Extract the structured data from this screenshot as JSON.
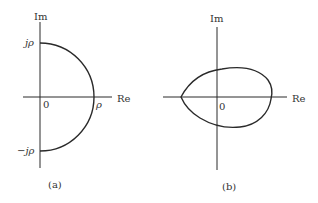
{
  "diagrams": [
    {
      "id": "a",
      "caption": "(a)",
      "axis_labels": {
        "imag": "Im",
        "real": "Re"
      },
      "origin_label": "0",
      "tick_labels": {
        "top": "jρ",
        "bottom": "−jρ",
        "right": "ρ"
      },
      "curve": "semicircle of radius ρ in right half-plane"
    },
    {
      "id": "b",
      "caption": "(b)",
      "axis_labels": {
        "imag": "Im",
        "real": "Re"
      },
      "origin_label": "0",
      "curve": "closed egg-shaped contour encircling origin"
    }
  ],
  "colors": {
    "stroke": "#2a2a2a",
    "text": "#333333",
    "background": "#ffffff"
  }
}
